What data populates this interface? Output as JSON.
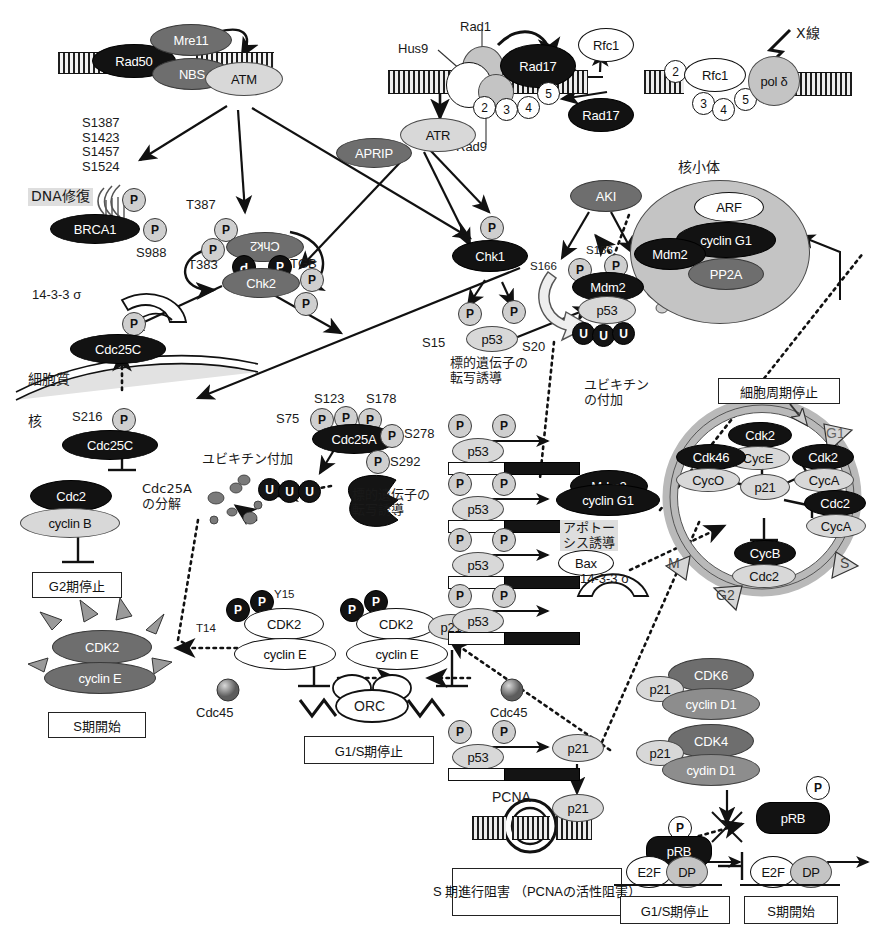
{
  "figure": {
    "colors": {
      "dark": "#121212",
      "mid": "#6e6e6e",
      "light": "#d8d8d8",
      "white": "#ffffff",
      "phospho": "#cfcfcf",
      "highlight": "#dedede"
    }
  },
  "damage_sensing": {
    "mrn": {
      "rad50": "Rad50",
      "mre11": "Mre11",
      "nbs": "NBS"
    },
    "atm": "ATM",
    "atm_sites": "S1387\nS1423\nS1457\nS1524",
    "dna_repair_label": "DNA修復",
    "brca1": "BRCA1",
    "brca1_site": "S988",
    "xray": "X線"
  },
  "rad_complex": {
    "rad1": "Rad1",
    "hus9": "Hus9",
    "rad9": "Rad9",
    "rad17": "Rad17",
    "subunits": [
      "2",
      "3",
      "4",
      "5"
    ],
    "atr": "ATR",
    "aprip": "APRIP"
  },
  "rfc_complex": {
    "rfc1_free": "Rfc1",
    "rad17_free": "Rad17",
    "rfc1_bound": "Rfc1",
    "pol_delta": "pol δ",
    "subunits": [
      "2",
      "3",
      "4",
      "5"
    ]
  },
  "chk2": {
    "name": "Chk2",
    "t387": "T387",
    "t383": "T383",
    "tgb": "TGB",
    "p_label": "P"
  },
  "chk1": {
    "name": "Chk1"
  },
  "akt": {
    "name": "AKI",
    "s166": "S166",
    "s186": "S186"
  },
  "nucleolus": {
    "label": "核小体",
    "arf": "ARF",
    "cyclin_g1": "cyclin G1",
    "mdm2": "Mdm2",
    "pp2a": "PP2A"
  },
  "mdm2_p53": {
    "mdm2": "Mdm2",
    "p53": "p53",
    "ubiquitin": "U",
    "ubiquitination_label": "ユビキチン\nの付加",
    "mdm2_gene_product": "Mdm2"
  },
  "p53_activation": {
    "s15": "S15",
    "s20": "S20",
    "p53": "p53",
    "target_gene_label": "標的遺伝子の\n転写誘導"
  },
  "cdc25c": {
    "sigma_label": "14-3-3 σ",
    "name": "Cdc25C",
    "cytoplasm": "細胞質",
    "nucleus": "核",
    "s216": "S216",
    "cdc2": "Cdc2",
    "cyclin_b": "cyclin B",
    "g2_arrest": "G2期停止"
  },
  "cdc25a": {
    "name": "Cdc25A",
    "sites": {
      "s75": "S75",
      "s123": "S123",
      "s178": "S178",
      "s278": "S278",
      "s292": "S292"
    },
    "ubiquitination": "ユビキチン付加",
    "degradation_label": "Cdc25A\nの分解",
    "target_gene_label": "標的遺伝子の\n転写誘導",
    "ubiquitin": "U"
  },
  "cdk2_active": {
    "cdk2": "CDK2",
    "cyclin_e": "cyclin E",
    "s_phase_start": "S期開始"
  },
  "cdk2_inhibited": {
    "cdk2": "CDK2",
    "cyclin_e": "cyclin E",
    "t14": "T14",
    "y15": "Y15",
    "p21": "p21",
    "cdc45": "Cdc45",
    "orc": "ORC",
    "g1s_arrest": "G1/S期停止"
  },
  "p53_targets": [
    {
      "product": "Mdm2",
      "style": "dark-ellipse",
      "note": ""
    },
    {
      "product": "cyclin G1",
      "style": "dark-ellipse",
      "note": "アポトー\nシス誘導"
    },
    {
      "product": "Bax",
      "style": "white-ellipse",
      "note": ""
    },
    {
      "product": "14-3-3 σ",
      "style": "clamp",
      "note": ""
    },
    {
      "product": "p21",
      "style": "light-ellipse",
      "note": ""
    }
  ],
  "cell_cycle": {
    "arrest_box": "細胞周期停止",
    "phases": [
      "G1",
      "S",
      "G2",
      "M"
    ],
    "p21": "p21",
    "complexes": [
      {
        "cdk": "Cdk2",
        "cyc": "CycE"
      },
      {
        "cdk": "Cdk46",
        "cyc": "CycO"
      },
      {
        "cdk": "Cdk2",
        "cyc": "CycA"
      },
      {
        "cdk": "Cdc2",
        "cyc": "CycA"
      },
      {
        "cdk": "CycB",
        "cyc": "Cdc2"
      }
    ]
  },
  "pcna": {
    "label": "PCNA",
    "p21": "p21",
    "box": "S 期進行阻害\n（PCNAの活性阻害）"
  },
  "cdk46_p21": {
    "cdk6": "CDK6",
    "cyclin_d1_6": "cyclin D1",
    "cdk4": "CDK4",
    "cyclin_d1_4": "cydin D1",
    "p21": "p21"
  },
  "prb": {
    "prb_free": "pRB",
    "prb_bound": "pRB",
    "e2f": "E2F",
    "dp": "DP",
    "g1s_arrest": "G1/S期停止",
    "s_phase_start": "S期開始",
    "p_label": "P"
  }
}
